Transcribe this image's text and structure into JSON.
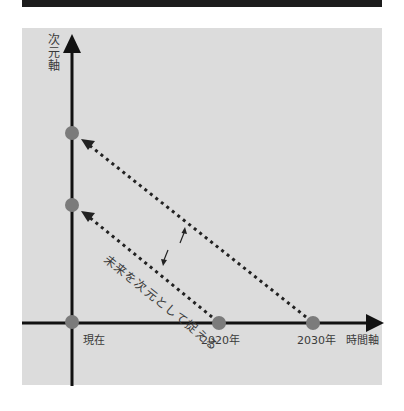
{
  "diagram": {
    "y_axis_label": "次元軸",
    "x_axis_label": "時間軸",
    "x_ticks": [
      {
        "label": "現在"
      },
      {
        "label": "2020年"
      },
      {
        "label": "2030年"
      }
    ],
    "center_caption": "未来を次元として捉える",
    "points": [
      {
        "name": "y-axis-upper",
        "x": 72,
        "y": 133
      },
      {
        "name": "y-axis-lower",
        "x": 72,
        "y": 205
      },
      {
        "name": "origin",
        "x": 72,
        "y": 322
      },
      {
        "name": "x-2020",
        "x": 219,
        "y": 323
      },
      {
        "name": "x-2030",
        "x": 313,
        "y": 323
      }
    ],
    "mappings": [
      {
        "from": "2030年",
        "to": "y-axis-upper"
      },
      {
        "from": "2020年",
        "to": "y-axis-lower"
      }
    ],
    "colors": {
      "panel": "#dcdcdc",
      "axis": "#111111",
      "dot": "#7b7b7b",
      "text": "#3a3a3a",
      "top_bar": "#1c1c1c"
    }
  }
}
